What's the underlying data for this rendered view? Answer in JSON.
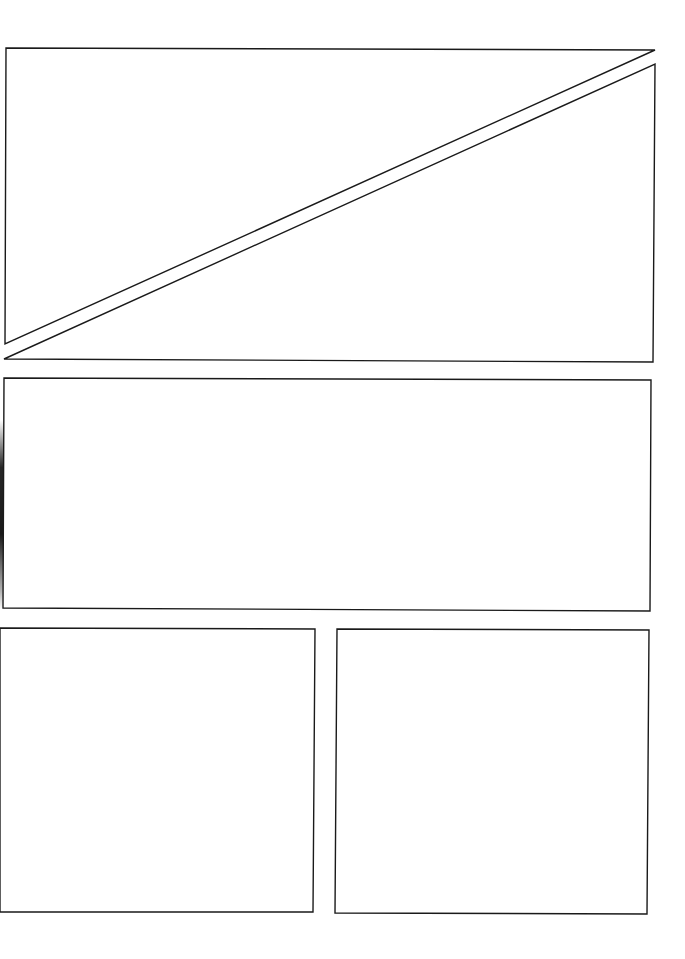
{
  "page": {
    "type": "comic-panel-template",
    "background": "#ffffff",
    "border_color": "#1a1a1a"
  },
  "panels": [
    {
      "id": "top-left-triangle",
      "shape": "polygon",
      "points": "6,48 655,50 5,344"
    },
    {
      "id": "top-right-triangle",
      "shape": "polygon",
      "points": "4,359 655,64 653,362"
    },
    {
      "id": "middle-wide",
      "shape": "polygon",
      "points": "4,378 651,380 650,611 3,608"
    },
    {
      "id": "bottom-left",
      "shape": "polygon",
      "points": "0,628 315,629 313,912 0,912"
    },
    {
      "id": "bottom-right",
      "shape": "polygon",
      "points": "337,629 649,630 647,914 335,913"
    }
  ]
}
